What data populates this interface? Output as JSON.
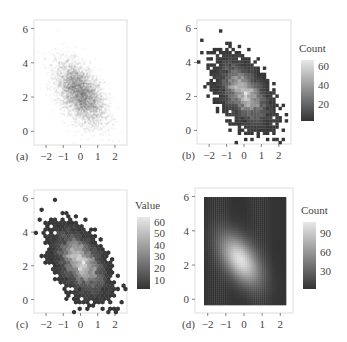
{
  "figure": {
    "panels": [
      {
        "id": "a",
        "label": "(a)",
        "kind": "scatter-alpha",
        "legend": null
      },
      {
        "id": "b",
        "label": "(b)",
        "kind": "square-bin",
        "legend": {
          "title": "Count",
          "ticks": [
            20,
            40,
            60
          ],
          "min": 2,
          "max": 66
        }
      },
      {
        "id": "c",
        "label": "(c)",
        "kind": "hex-bin",
        "legend": {
          "title": "Value",
          "ticks": [
            10,
            20,
            30,
            40,
            50,
            60
          ],
          "min": 2,
          "max": 64
        }
      },
      {
        "id": "d",
        "label": "(d)",
        "kind": "smoothed-density",
        "legend": {
          "title": "Count",
          "ticks": [
            30,
            60,
            90
          ],
          "min": 2,
          "max": 108
        }
      }
    ],
    "x_ticks": [
      -2,
      -1,
      0,
      1,
      2
    ],
    "y_ticks": [
      0,
      2,
      4,
      6
    ],
    "colors": {
      "low": "#333333",
      "high": "#e8e8e8",
      "point": "#555555",
      "frame": "#dddddd"
    }
  },
  "chart_data": [
    {
      "type": "scatter",
      "panel": "(a)",
      "title": "",
      "description": "Semi-transparent scatter of a bivariate normal sample, negatively correlated",
      "xlabel": "",
      "ylabel": "",
      "xlim": [
        -2.7,
        2.7
      ],
      "ylim": [
        -0.8,
        6.5
      ],
      "x_ticks": [
        -2,
        -1,
        0,
        1,
        2
      ],
      "y_ticks": [
        0,
        2,
        4,
        6
      ],
      "center": [
        0,
        2.2
      ],
      "sd": [
        0.7,
        0.9
      ],
      "correlation": -0.5,
      "grid": false
    },
    {
      "type": "heatmap",
      "panel": "(b)",
      "title": "",
      "description": "Square 2D binning of the same sample",
      "xlim": [
        -2.7,
        2.7
      ],
      "ylim": [
        -0.8,
        6.5
      ],
      "x_ticks": [
        -2,
        -1,
        0,
        1,
        2
      ],
      "y_ticks": [
        0,
        2,
        4,
        6
      ],
      "legend": {
        "title": "Count",
        "ticks": [
          20,
          40,
          60
        ],
        "range": [
          1,
          66
        ]
      },
      "peak": [
        -0.2,
        2.3
      ]
    },
    {
      "type": "heatmap",
      "panel": "(c)",
      "title": "",
      "description": "Hexagonal 2D binning of the same sample",
      "xlim": [
        -2.7,
        2.7
      ],
      "ylim": [
        -0.8,
        6.5
      ],
      "x_ticks": [
        -2,
        -1,
        0,
        1,
        2
      ],
      "y_ticks": [
        0,
        2,
        4,
        6
      ],
      "legend": {
        "title": "Value",
        "ticks": [
          10,
          20,
          30,
          40,
          50,
          60
        ],
        "range": [
          1,
          64
        ]
      },
      "peak": [
        -0.3,
        2.4
      ]
    },
    {
      "type": "heatmap",
      "panel": "(d)",
      "title": "",
      "description": "Smoothed 2D density (count) raster",
      "xlim": [
        -2.7,
        2.7
      ],
      "ylim": [
        -0.8,
        6.5
      ],
      "x_ticks": [
        -2,
        -1,
        0,
        1,
        2
      ],
      "y_ticks": [
        0,
        2,
        4,
        6
      ],
      "legend": {
        "title": "Count",
        "ticks": [
          30,
          60,
          90
        ],
        "range": [
          1,
          108
        ]
      },
      "peak": [
        -0.2,
        2.3
      ]
    }
  ]
}
